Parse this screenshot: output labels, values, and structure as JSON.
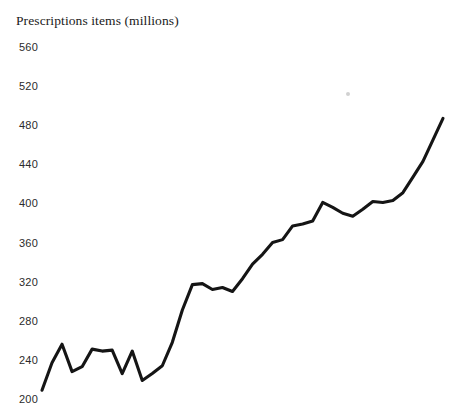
{
  "chart_data": {
    "type": "line",
    "title": "Prescriptions items (millions)",
    "xlabel": "",
    "ylabel": "Prescriptions items (millions)",
    "ylim": [
      200,
      560
    ],
    "ytick_labels": [
      "560",
      "520",
      "480",
      "440",
      "400",
      "360",
      "320",
      "280",
      "240",
      "200"
    ],
    "yticks": [
      560,
      520,
      480,
      440,
      400,
      360,
      320,
      280,
      240,
      200
    ],
    "grid": false,
    "legend": false,
    "axis_lines": false,
    "series": [
      {
        "name": "Prescription items",
        "color": "#151515",
        "x": [
          0,
          1,
          2,
          3,
          4,
          5,
          6,
          7,
          8,
          9,
          10,
          11,
          12,
          13,
          14,
          15,
          16,
          17,
          18,
          19,
          20,
          21,
          22,
          23,
          24,
          25,
          26,
          27,
          28,
          29,
          30,
          31,
          32,
          33,
          34,
          35,
          36,
          37,
          38,
          39,
          40
        ],
        "values": [
          209,
          237,
          256,
          228,
          233,
          251,
          249,
          250,
          226,
          249,
          219,
          226,
          234,
          258,
          291,
          317,
          318,
          312,
          314,
          310,
          323,
          338,
          348,
          360,
          363,
          377,
          379,
          382,
          401,
          396,
          390,
          387,
          394,
          402,
          401,
          403,
          411,
          427,
          443,
          465,
          487
        ]
      }
    ]
  },
  "marks": {
    "speck_label": "image-artifact-speck"
  }
}
